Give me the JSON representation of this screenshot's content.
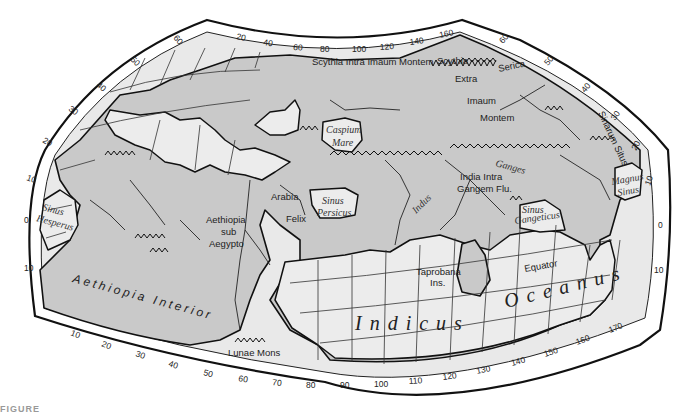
{
  "map": {
    "title": "Ptolemy's World Map",
    "colors": {
      "land": "#c9c9c9",
      "sea": "#ececec",
      "frame": "#ffffff",
      "ink": "#111111"
    },
    "top_scale": [
      "20",
      "40",
      "60",
      "80",
      "100",
      "120",
      "140",
      "160"
    ],
    "bottom_scale": [
      "10",
      "20",
      "30",
      "40",
      "50",
      "60",
      "70",
      "80",
      "90",
      "100",
      "110",
      "120",
      "130",
      "140",
      "150",
      "160",
      "170"
    ],
    "left_scale": [
      "60",
      "50",
      "40",
      "30",
      "20",
      "10",
      "0",
      "10"
    ],
    "right_scale": [
      "60",
      "50",
      "40",
      "30",
      "20",
      "10",
      "0",
      "10"
    ],
    "labels": {
      "scythia_intra": "Scythia Intra Imaum Montem",
      "scythia": "Scythia",
      "extra": "Extra",
      "imaum": "Imaum",
      "montem": "Montem",
      "serica": "Serica",
      "sinarum_situs": "Sinarum Situs",
      "caspium": "Caspium",
      "mare": "Mare",
      "ganges": "Ganges",
      "india_intra": "India Intra",
      "gangem_flu": "Gangem Flu.",
      "indus": "Indus",
      "magnus": "Magnus",
      "sinus_m": "Sinus",
      "sinus_h": "Sinus",
      "hesperus": "Hesperus",
      "arabia": "Arabia",
      "felix": "Felix",
      "sinus_p": "Sinus",
      "persicus": "Persicus",
      "aethiopia": "Aethiopia",
      "sub": "sub",
      "aegypto": "Aegypto",
      "sinus_g": "Sinus",
      "gangeticus": "Gangeticus",
      "taprobana": "Taprobana",
      "ins": "Ins.",
      "equator": "Equator",
      "aethiopia_interior": "Aethiopia  Interior",
      "indicus": "Indicus",
      "oceanus": "Oceanus",
      "lunae_mons": "Lunae Mons"
    },
    "caption": "FIGURE"
  }
}
